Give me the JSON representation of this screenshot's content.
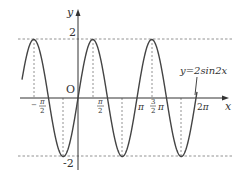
{
  "figure": {
    "function_label": "y=2sin2x",
    "axis_x_label": "x",
    "axis_y_label": "y",
    "origin_label": "O",
    "y_ticks": [
      {
        "label": "2",
        "value": 2
      },
      {
        "label": "-2",
        "value": -2
      }
    ],
    "x_ticks": [
      {
        "label": "-π/2",
        "value": "-pi/2"
      },
      {
        "label": "π/2",
        "value": "pi/2"
      },
      {
        "label": "π",
        "value": "pi"
      },
      {
        "label": "3/2π",
        "value": "3pi/2"
      },
      {
        "label": "2π",
        "value": "2pi"
      }
    ],
    "colors": {
      "curve": "#444444",
      "axes": "#333333",
      "dashed": "#666666"
    }
  },
  "chart_data": {
    "type": "line",
    "xlabel": "x",
    "ylabel": "y",
    "function": "y = 2*sin(2*x)",
    "x_range": [
      "-15pi/16",
      "2pi"
    ],
    "ylim": [
      -2,
      2
    ],
    "amplitude": 2,
    "period": "pi",
    "maxima_x": [
      "-3pi/4",
      "pi/4",
      "5pi/4"
    ],
    "minima_x": [
      "-pi/4",
      "3pi/4",
      "7pi/4"
    ],
    "dashed_reference_lines": [
      "y=2",
      "y=-2",
      "verticals at extrema"
    ],
    "grid": false
  }
}
